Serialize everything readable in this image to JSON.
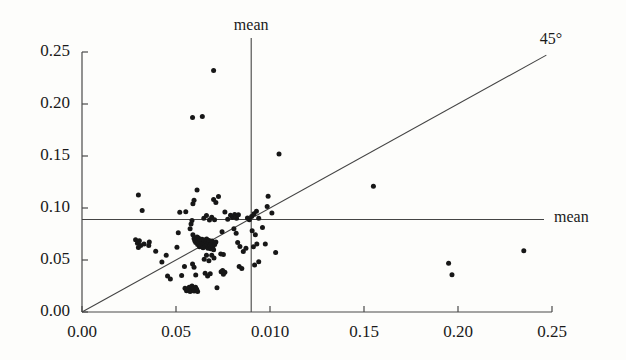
{
  "chart_data": {
    "type": "scatter",
    "title": "",
    "xlabel": "",
    "ylabel": "",
    "xlim": [
      0.0,
      0.25
    ],
    "ylim": [
      0.0,
      0.25
    ],
    "grid": false,
    "legend": "none",
    "marker": {
      "shape": "circle",
      "color": "#171717",
      "size_px": 5
    },
    "xticks": [
      0.0,
      0.05,
      0.1,
      0.15,
      0.2,
      0.25
    ],
    "yticks": [
      0.0,
      0.05,
      0.1,
      0.15,
      0.2,
      0.25
    ],
    "xticklabels": [
      "0.00",
      "0.05",
      "0.010",
      "0.15",
      "0.20",
      "0.25"
    ],
    "yticklabels": [
      "0.00",
      "0.05",
      "0.10",
      "0.15",
      "0.20",
      "0.25"
    ],
    "annotations": [
      {
        "text": "mean",
        "role": "vertical-mean-label",
        "x": 0.09,
        "y": 0.265
      },
      {
        "text": "mean",
        "role": "horizontal-mean-label",
        "x": 0.258,
        "y": 0.089
      },
      {
        "text": "45°",
        "role": "identity-line-label",
        "x": 0.253,
        "y": 0.262
      }
    ],
    "reference_lines": [
      {
        "name": "vertical-mean",
        "orientation": "vertical",
        "value": 0.09,
        "color": "#444444"
      },
      {
        "name": "horizontal-mean",
        "orientation": "horizontal",
        "value": 0.089,
        "color": "#444444"
      },
      {
        "name": "identity-45deg",
        "orientation": "diagonal",
        "from": [
          0.0,
          0.0
        ],
        "to": [
          0.247,
          0.247
        ],
        "color": "#444444"
      }
    ],
    "points": [
      [
        0.0285,
        0.0695
      ],
      [
        0.0295,
        0.066
      ],
      [
        0.0305,
        0.0685
      ],
      [
        0.0312,
        0.064
      ],
      [
        0.03,
        0.062
      ],
      [
        0.033,
        0.0655
      ],
      [
        0.0355,
        0.064
      ],
      [
        0.0358,
        0.0672
      ],
      [
        0.03,
        0.1125
      ],
      [
        0.032,
        0.0975
      ],
      [
        0.0392,
        0.0585
      ],
      [
        0.0425,
        0.048
      ],
      [
        0.0448,
        0.0545
      ],
      [
        0.0455,
        0.0345
      ],
      [
        0.047,
        0.0318
      ],
      [
        0.0505,
        0.0622
      ],
      [
        0.0512,
        0.0762
      ],
      [
        0.052,
        0.096
      ],
      [
        0.053,
        0.0352
      ],
      [
        0.0545,
        0.0438
      ],
      [
        0.0552,
        0.0965
      ],
      [
        0.0548,
        0.0228
      ],
      [
        0.0556,
        0.0205
      ],
      [
        0.0562,
        0.0222
      ],
      [
        0.057,
        0.0238
      ],
      [
        0.0575,
        0.0196
      ],
      [
        0.058,
        0.0215
      ],
      [
        0.0585,
        0.025
      ],
      [
        0.0592,
        0.0228
      ],
      [
        0.0596,
        0.0202
      ],
      [
        0.0604,
        0.0238
      ],
      [
        0.061,
        0.0218
      ],
      [
        0.0615,
        0.0196
      ],
      [
        0.0588,
        0.0462
      ],
      [
        0.0596,
        0.043
      ],
      [
        0.0605,
        0.0355
      ],
      [
        0.059,
        0.104
      ],
      [
        0.0596,
        0.1075
      ],
      [
        0.0612,
        0.1172
      ],
      [
        0.0588,
        0.187
      ],
      [
        0.064,
        0.188
      ],
      [
        0.07,
        0.2322
      ],
      [
        0.0575,
        0.08
      ],
      [
        0.058,
        0.0845
      ],
      [
        0.0585,
        0.088
      ],
      [
        0.059,
        0.0742
      ],
      [
        0.0596,
        0.0706
      ],
      [
        0.06,
        0.0685
      ],
      [
        0.0605,
        0.0668
      ],
      [
        0.0608,
        0.0702
      ],
      [
        0.0612,
        0.0722
      ],
      [
        0.0615,
        0.0648
      ],
      [
        0.0618,
        0.0682
      ],
      [
        0.062,
        0.0712
      ],
      [
        0.0622,
        0.0658
      ],
      [
        0.0625,
        0.0628
      ],
      [
        0.0628,
        0.069
      ],
      [
        0.063,
        0.0662
      ],
      [
        0.0633,
        0.0635
      ],
      [
        0.0636,
        0.0675
      ],
      [
        0.0638,
        0.07
      ],
      [
        0.0641,
        0.0648
      ],
      [
        0.0644,
        0.0618
      ],
      [
        0.0647,
        0.0668
      ],
      [
        0.065,
        0.0692
      ],
      [
        0.0653,
        0.0655
      ],
      [
        0.0656,
        0.0628
      ],
      [
        0.066,
        0.0678
      ],
      [
        0.0663,
        0.0702
      ],
      [
        0.0666,
        0.0645
      ],
      [
        0.067,
        0.0612
      ],
      [
        0.0673,
        0.0665
      ],
      [
        0.0676,
        0.0688
      ],
      [
        0.068,
        0.0638
      ],
      [
        0.0684,
        0.0608
      ],
      [
        0.0688,
        0.0658
      ],
      [
        0.0692,
        0.0682
      ],
      [
        0.0696,
        0.0628
      ],
      [
        0.07,
        0.0598
      ],
      [
        0.0706,
        0.0648
      ],
      [
        0.0712,
        0.0672
      ],
      [
        0.065,
        0.0508
      ],
      [
        0.0662,
        0.0545
      ],
      [
        0.0675,
        0.0492
      ],
      [
        0.069,
        0.0545
      ],
      [
        0.0702,
        0.052
      ],
      [
        0.0655,
        0.0372
      ],
      [
        0.0668,
        0.0345
      ],
      [
        0.0682,
        0.0368
      ],
      [
        0.0648,
        0.0902
      ],
      [
        0.0662,
        0.0928
      ],
      [
        0.0678,
        0.0885
      ],
      [
        0.069,
        0.0912
      ],
      [
        0.0705,
        0.0886
      ],
      [
        0.07,
        0.1082
      ],
      [
        0.0712,
        0.1052
      ],
      [
        0.0726,
        0.111
      ],
      [
        0.0718,
        0.0232
      ],
      [
        0.074,
        0.0388
      ],
      [
        0.0752,
        0.0362
      ],
      [
        0.0748,
        0.04
      ],
      [
        0.076,
        0.0382
      ],
      [
        0.0738,
        0.0558
      ],
      [
        0.0752,
        0.0552
      ],
      [
        0.0745,
        0.0772
      ],
      [
        0.076,
        0.0962
      ],
      [
        0.0775,
        0.0892
      ],
      [
        0.079,
        0.093
      ],
      [
        0.08,
        0.0908
      ],
      [
        0.0812,
        0.0938
      ],
      [
        0.0822,
        0.0902
      ],
      [
        0.0832,
        0.0935
      ],
      [
        0.0808,
        0.08
      ],
      [
        0.082,
        0.0758
      ],
      [
        0.0828,
        0.0668
      ],
      [
        0.084,
        0.063
      ],
      [
        0.0836,
        0.0438
      ],
      [
        0.085,
        0.0418
      ],
      [
        0.0858,
        0.0582
      ],
      [
        0.0872,
        0.0612
      ],
      [
        0.088,
        0.0905
      ],
      [
        0.089,
        0.0888
      ],
      [
        0.0902,
        0.0918
      ],
      [
        0.0915,
        0.0945
      ],
      [
        0.0928,
        0.0968
      ],
      [
        0.094,
        0.0902
      ],
      [
        0.0905,
        0.0782
      ],
      [
        0.0922,
        0.0742
      ],
      [
        0.0912,
        0.0628
      ],
      [
        0.093,
        0.0655
      ],
      [
        0.0918,
        0.0452
      ],
      [
        0.094,
        0.0482
      ],
      [
        0.096,
        0.0812
      ],
      [
        0.0975,
        0.0655
      ],
      [
        0.0985,
        0.1015
      ],
      [
        0.099,
        0.1112
      ],
      [
        0.101,
        0.0952
      ],
      [
        0.103,
        0.0572
      ],
      [
        0.1048,
        0.152
      ],
      [
        0.155,
        0.121
      ],
      [
        0.195,
        0.0468
      ],
      [
        0.1968,
        0.0358
      ],
      [
        0.235,
        0.059
      ]
    ]
  },
  "layout": {
    "plot_left_px": 82,
    "plot_right_px": 552,
    "plot_top_px": 52,
    "plot_bottom_px": 312
  }
}
